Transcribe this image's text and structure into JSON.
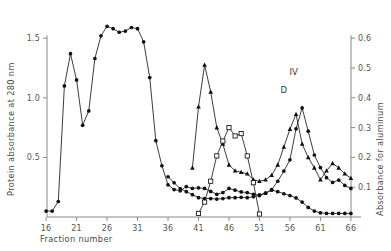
{
  "chart_data": {
    "type": "line",
    "title": "",
    "xlabel": "Fraction number",
    "ylabel": "Protein absorbance at 280 nm",
    "y2label": "Absorbance  for  aluminum",
    "xlim": [
      15,
      67
    ],
    "ylim": [
      0,
      1.72
    ],
    "y2lim": [
      0,
      0.688
    ],
    "grid": false,
    "legend": "none",
    "xticks": [
      16,
      21,
      26,
      31,
      36,
      41,
      46,
      51,
      56,
      61,
      66
    ],
    "xticklabels": [
      "16",
      "21",
      "26",
      "31",
      "36",
      "41",
      "46",
      "51",
      "56",
      "61",
      "66"
    ],
    "yticks": [
      0.5,
      1.0,
      1.5
    ],
    "yticklabels": [
      "0.5",
      "1.0",
      "1.5"
    ],
    "y2ticks": [
      0.1,
      0.2,
      0.3,
      0.4,
      0.5,
      0.6
    ],
    "y2ticklabels": [
      "0.1",
      "0.2",
      "0.3",
      "0.4",
      "0.5",
      "0.6"
    ],
    "annotations": [
      {
        "text": "C",
        "x": 41.3,
        "y": 1.12,
        "marker_series": "protein-absorbance"
      },
      {
        "text": "D",
        "x": 55.0,
        "y": 0.395,
        "marker_series": "protein-absorbance"
      },
      {
        "text": "IV",
        "x": 56.6,
        "y": 0.455,
        "marker_series": "protein-absorbance"
      }
    ],
    "series": [
      {
        "name": "protein-absorbance",
        "axis": "left",
        "marker": "filled-circle",
        "x": [
          16,
          17,
          18,
          19,
          20,
          21,
          22,
          23,
          24,
          25,
          26,
          27,
          28,
          29,
          30,
          31,
          32,
          33,
          34,
          35,
          36,
          37,
          38,
          39,
          40,
          41,
          42,
          43,
          44,
          45,
          46,
          47,
          48,
          49,
          50,
          51,
          52,
          53,
          54,
          55,
          56,
          57,
          58,
          59,
          60,
          61,
          62,
          63,
          64,
          65,
          66
        ],
        "y": [
          0.05,
          0.05,
          0.13,
          1.1,
          1.37,
          1.15,
          0.77,
          0.89,
          1.33,
          1.52,
          1.6,
          1.58,
          1.55,
          1.56,
          1.59,
          1.58,
          1.47,
          1.17,
          0.64,
          0.43,
          0.27,
          0.23,
          0.22,
          0.255,
          0.24,
          0.245,
          0.24,
          0.215,
          0.19,
          0.205,
          0.24,
          0.225,
          0.21,
          0.205,
          0.19,
          0.185,
          0.2,
          0.23,
          0.3,
          0.385,
          0.48,
          0.74,
          0.915,
          0.72,
          0.52,
          0.415,
          0.33,
          0.29,
          0.31,
          0.265,
          0.24
        ]
      },
      {
        "name": "aluminum-peak-c",
        "axis": "right",
        "marker": "filled-triangle",
        "x": [
          40,
          41,
          42,
          43,
          44,
          45,
          46,
          47,
          48,
          49,
          50,
          51,
          52,
          53,
          54,
          55,
          56,
          57,
          58,
          59,
          60,
          61,
          62,
          63,
          64,
          65,
          66
        ],
        "y": [
          0.165,
          0.37,
          0.51,
          0.42,
          0.3,
          0.245,
          0.175,
          0.155,
          0.15,
          0.145,
          0.125,
          0.12,
          0.125,
          0.14,
          0.175,
          0.235,
          0.295,
          0.345,
          0.245,
          0.2,
          0.165,
          0.125,
          0.155,
          0.18,
          0.165,
          0.145,
          0.13
        ]
      },
      {
        "name": "aluminum-baseline",
        "axis": "right",
        "marker": "filled-circle",
        "x": [
          36,
          37,
          38,
          39,
          40,
          41,
          42,
          43,
          44,
          45,
          46,
          47,
          48,
          49,
          50,
          51,
          52,
          53,
          54,
          55,
          56,
          57,
          58,
          59,
          60,
          61,
          62,
          63,
          64,
          65,
          66
        ],
        "y": [
          0.135,
          0.115,
          0.095,
          0.085,
          0.075,
          0.065,
          0.062,
          0.062,
          0.06,
          0.062,
          0.065,
          0.065,
          0.066,
          0.065,
          0.068,
          0.072,
          0.08,
          0.09,
          0.085,
          0.078,
          0.072,
          0.064,
          0.05,
          0.032,
          0.02,
          0.014,
          0.012,
          0.012,
          0.012,
          0.012,
          0.012
        ]
      },
      {
        "name": "aluminum-open-square",
        "axis": "right",
        "marker": "open-square",
        "x": [
          41,
          42,
          43,
          44,
          45,
          46,
          47,
          48,
          49,
          50,
          51
        ],
        "y": [
          0.012,
          0.05,
          0.12,
          0.205,
          0.255,
          0.3,
          0.272,
          0.28,
          0.205,
          0.115,
          0.01
        ]
      }
    ]
  }
}
